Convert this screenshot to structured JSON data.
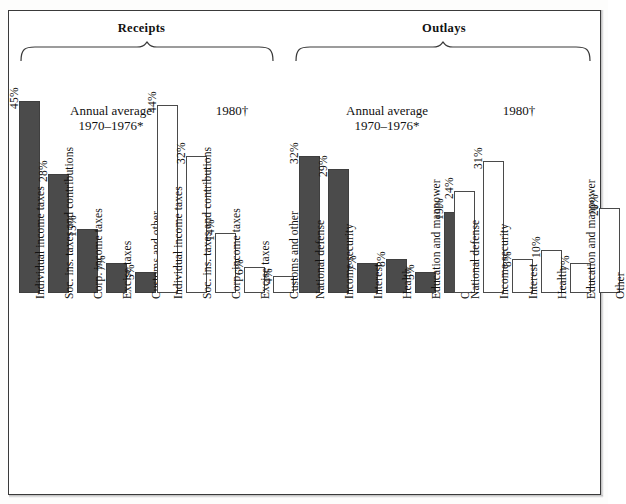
{
  "figure": {
    "groups": [
      {
        "name": "receipts",
        "title": "Receipts"
      },
      {
        "name": "outlays",
        "title": "Outlays"
      }
    ],
    "series_captions": {
      "average_line1": "Annual average",
      "average_line2": "1970–1976*",
      "year_1980": "1980†"
    },
    "colors": {
      "filled_bar": "#4b4b4b",
      "hollow_bar_border": "#4a4a4a",
      "frame": "#3a3a3a",
      "text": "#111111"
    }
  },
  "chart_data": {
    "type": "bar",
    "xlabel": "",
    "ylabel": "",
    "ylim": [
      0,
      45
    ],
    "grid": false,
    "legend": [
      "Annual average 1970–1976*",
      "1980†"
    ],
    "legend_position": "inline-above-groups",
    "annotations": [
      "*",
      "†"
    ],
    "panels": [
      {
        "panel": "Receipts",
        "categories": [
          "Individual income taxes",
          "Soc. ins. taxes and contributions",
          "Corp. income taxes",
          "Excise taxes",
          "Customs and other"
        ],
        "series": [
          {
            "name": "Annual average 1970–1976*",
            "style": "filled",
            "values": [
              45,
              28,
              15,
              7,
              5
            ],
            "labels": [
              "45%",
              "28%",
              "15%",
              "7%",
              "5%"
            ]
          },
          {
            "name": "1980†",
            "style": "hollow",
            "values": [
              44,
              32,
              14,
              6,
              4
            ],
            "labels": [
              "44%",
              "32%",
              "14%",
              "6%",
              "4%"
            ]
          }
        ]
      },
      {
        "panel": "Outlays",
        "categories": [
          "National defense",
          "Income security",
          "Interest",
          "Health",
          "Education and manpower",
          "Other"
        ],
        "series": [
          {
            "name": "Annual average 1970–1976*",
            "style": "filled",
            "values": [
              32,
              29,
              7,
              8,
              5,
              19
            ],
            "labels": [
              "32%",
              "29%",
              "7%",
              "8%",
              "5%",
              "19%"
            ]
          },
          {
            "name": "1980†",
            "style": "hollow",
            "values": [
              24,
              31,
              8,
              10,
              7,
              20
            ],
            "labels": [
              "24%",
              "31%",
              "8%",
              "10%",
              "7%",
              "20%"
            ]
          }
        ]
      }
    ]
  }
}
